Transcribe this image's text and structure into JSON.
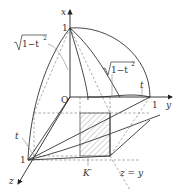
{
  "diagram": {
    "type": "3d-solid-cross-section",
    "axes": {
      "x": {
        "label": "x",
        "tick": "1"
      },
      "y": {
        "label": "y",
        "tick": "1"
      },
      "z": {
        "label": "z",
        "tick": "1"
      }
    },
    "origin_label": "O",
    "labels": {
      "sqrt_left": "1−t",
      "sqrt_left_exp": "2",
      "sqrt_right": "1−t",
      "sqrt_right_exp": "2",
      "t_right": "t",
      "t_left": "t",
      "section": "K′",
      "plane": "z = y"
    },
    "colors": {
      "line": "#333333",
      "dashed": "#888888",
      "hatch": "#999999",
      "text": "#333333"
    }
  }
}
